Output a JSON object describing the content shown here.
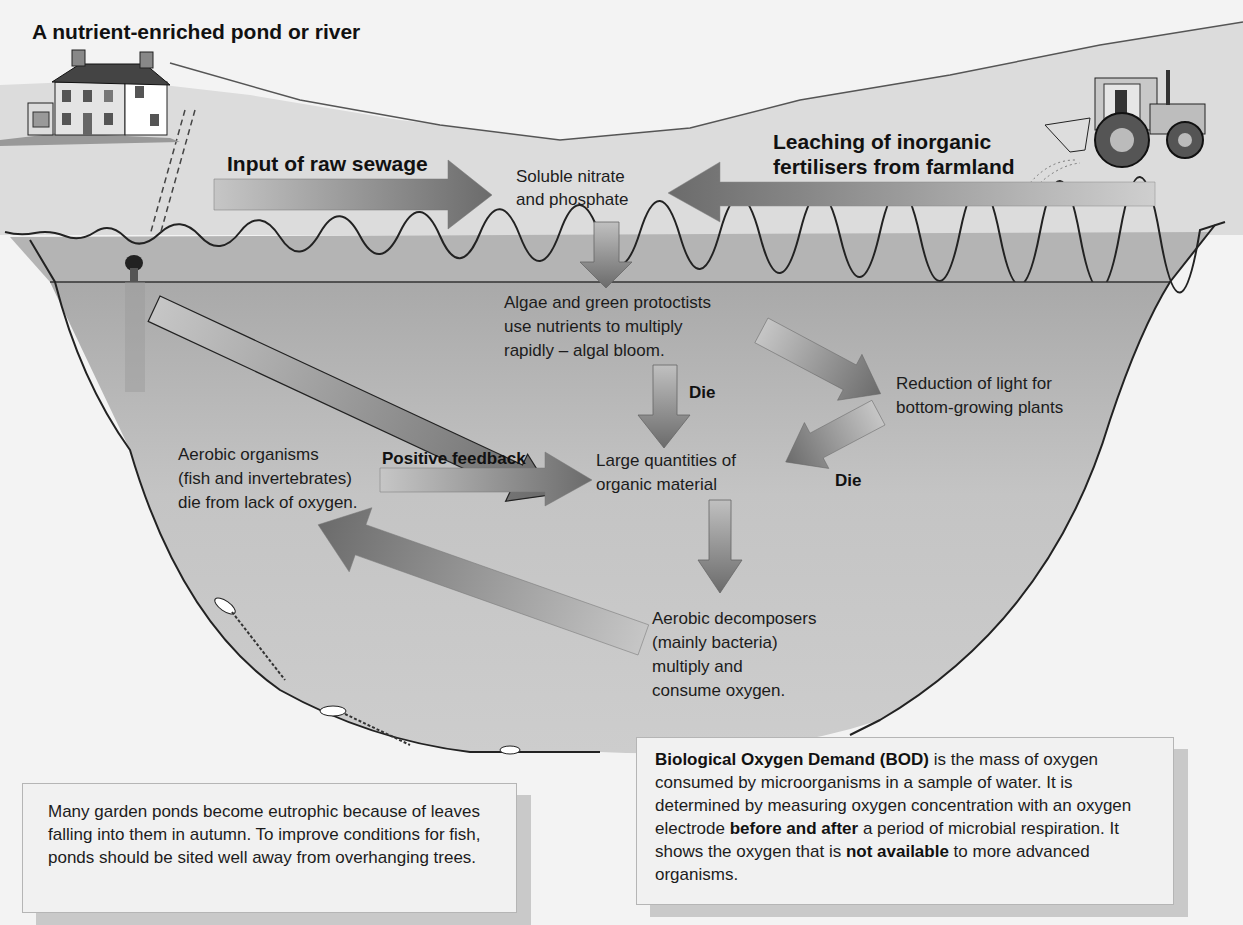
{
  "diagram": {
    "title": "A nutrient-enriched pond or river",
    "sources": {
      "sewage": "Input of raw sewage",
      "fertiliser_line1": "Leaching of inorganic",
      "fertiliser_line2": "fertilisers from farmland"
    },
    "nodes": {
      "nutrients": [
        "Soluble nitrate",
        "and phosphate"
      ],
      "algae": [
        "Algae and green protoctists",
        "use nutrients to multiply",
        "rapidly – algal bloom."
      ],
      "light": [
        "Reduction of light for",
        "bottom-growing plants"
      ],
      "organic": [
        "Large quantities of",
        "organic material"
      ],
      "aerobic_organisms": [
        "Aerobic organisms",
        "(fish and invertebrates)",
        "die from lack of oxygen."
      ],
      "decomposers": [
        "Aerobic decomposers",
        "(mainly bacteria)",
        "multiply and",
        "consume oxygen."
      ]
    },
    "edge_labels": {
      "die_algae": "Die",
      "die_plants": "Die",
      "positive_feedback": "Positive feedback"
    },
    "illustrations": [
      "house",
      "tractor-spreader",
      "sewage-pipe",
      "dead-fish"
    ]
  },
  "notes": {
    "garden_ponds": "Many garden ponds become eutrophic because of leaves falling into them in autumn. To improve conditions for fish, ponds should be sited well away from overhanging trees.",
    "bod": {
      "term": "Biological Oxygen Demand (BOD)",
      "part1": " is the mass of oxygen consumed by microorganisms in a sample of water. It is determined by measuring oxygen concentration with an oxygen electrode ",
      "emph1": "before and after",
      "part2": " a period of microbial respiration. It shows the oxygen that is ",
      "emph2": "not available",
      "part3": " to more advanced organisms."
    }
  },
  "colors": {
    "arrow_dark": "#6e6e6e",
    "arrow_light": "#c4c4c4",
    "water": "#bdbdbd",
    "grass_band": "#b3b3b3",
    "land": "#dadada",
    "background": "#f3f3f3"
  }
}
